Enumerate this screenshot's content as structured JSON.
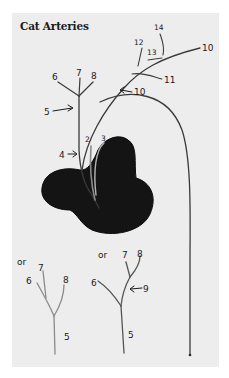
{
  "title": "Cat Arteries",
  "colors": {
    "paper": "#ededed",
    "ink": "#2a2a2a",
    "heart": "#141414",
    "pencil": "#8a8a8a"
  },
  "main_diagram": {
    "labels": {
      "l2": "2",
      "l3": "3",
      "l4": "4",
      "l5": "5",
      "l6": "6",
      "l7": "7",
      "l8": "8",
      "l10_arrow": "10",
      "l10_end": "10",
      "l11": "11",
      "l12": "12",
      "l13": "13",
      "l14": "14"
    }
  },
  "alt_diagram_left": {
    "labels": {
      "or": "or",
      "l7": "7",
      "l6": "6",
      "l8": "8",
      "l5": "5"
    }
  },
  "alt_diagram_right": {
    "labels": {
      "or": "or",
      "l7": "7",
      "l8": "8",
      "l6": "6",
      "l9": "9",
      "l5": "5"
    }
  }
}
